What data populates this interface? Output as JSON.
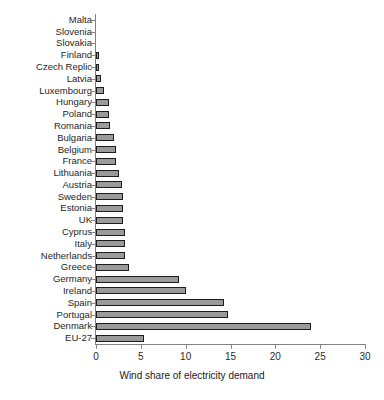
{
  "chart_data": {
    "type": "bar",
    "orientation": "horizontal",
    "title": "",
    "xlabel": "Wind share of electricity demand",
    "ylabel": "",
    "xlim": [
      0,
      30
    ],
    "xticks": [
      0,
      5,
      10,
      15,
      20,
      25,
      30
    ],
    "xtick_labels": [
      "0",
      "5",
      "10",
      "15",
      "20",
      "25",
      "30"
    ],
    "grid": false,
    "legend": false,
    "bar_fill_color": "#9a9a9a",
    "bar_edge_color": "#1c1c1c",
    "axis_color": "#808080",
    "categories": [
      "Malta",
      "Slovenia",
      "Slovakia",
      "Finland",
      "Czech Replic",
      "Latvia",
      "Luxembourg",
      "Hungary",
      "Poland",
      "Romania",
      "Bulgaria",
      "Belgium",
      "France",
      "Lithuania",
      "Austria",
      "Sweden",
      "Estonia",
      "UK",
      "Cyprus",
      "Italy",
      "Netherlands",
      "Greece",
      "Germany",
      "Ireland",
      "Spain",
      "Portugal",
      "Denmark",
      "EU-27"
    ],
    "values": [
      0.0,
      0.0,
      0.0,
      0.3,
      0.3,
      0.6,
      0.9,
      1.4,
      1.5,
      1.6,
      2.0,
      2.2,
      2.2,
      2.6,
      2.9,
      3.0,
      3.0,
      3.0,
      3.2,
      3.2,
      3.2,
      3.7,
      9.3,
      10.0,
      14.3,
      14.7,
      24.0,
      5.3
    ]
  }
}
